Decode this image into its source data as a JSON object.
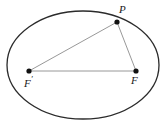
{
  "figure": {
    "background_color": "#ffffff",
    "stroke_color": "#2b2b2b",
    "segment_color": "#8c8c8c",
    "point_color": "#111111",
    "label_color": "#1a1a1a",
    "canvas": {
      "width": 168,
      "height": 130
    }
  },
  "ellipse": {
    "name": "ellipse-curve",
    "center_x": 83,
    "center_y": 65,
    "semi_major_axis": 76,
    "semi_minor_axis": 54,
    "stroke_width": 1.3
  },
  "points": [
    {
      "id": "P",
      "label": "P",
      "prime": "",
      "x": 117,
      "y": 22,
      "radius": 2.6,
      "description": "point on ellipse"
    },
    {
      "id": "Fp",
      "label": "F",
      "prime": "′",
      "x": 29,
      "y": 71,
      "radius": 2.6,
      "description": "left focus"
    },
    {
      "id": "F",
      "label": "F",
      "prime": "",
      "x": 136,
      "y": 71,
      "radius": 2.6,
      "description": "right focus"
    }
  ],
  "segments": [
    {
      "id": "Fp-F",
      "name": "segment-focus-to-focus",
      "from": "Fp",
      "to": "F",
      "x1": 29,
      "y1": 71,
      "x2": 136,
      "y2": 71,
      "stroke_width": 0.9
    },
    {
      "id": "Fp-P",
      "name": "segment-left-focus-to-P",
      "from": "Fp",
      "to": "P",
      "x1": 29,
      "y1": 71,
      "x2": 117,
      "y2": 22,
      "stroke_width": 0.9
    },
    {
      "id": "P-F",
      "name": "segment-P-to-right-focus",
      "from": "P",
      "to": "F",
      "x1": 117,
      "y1": 22,
      "x2": 136,
      "y2": 71,
      "stroke_width": 0.9
    }
  ],
  "labels": {
    "P": "P",
    "F_prime": "F",
    "F_prime_mark": "′",
    "F": "F"
  }
}
